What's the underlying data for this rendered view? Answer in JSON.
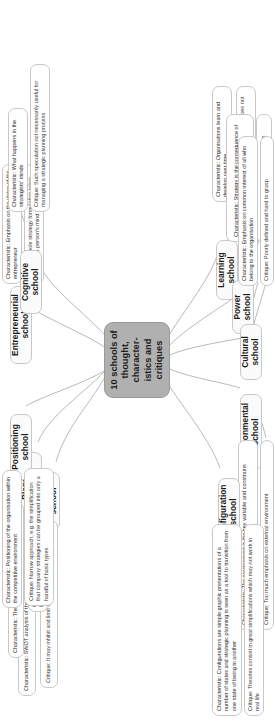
{
  "diagram": {
    "type": "mind-map",
    "central": {
      "label": "10 schools of thought, character-istics and critiques",
      "color": "#b0b0b0"
    },
    "branches": [
      {
        "school": "Design school",
        "characteristic": "Characteristic: SWOT analysis of the organisation",
        "critique": "Critique: It may inhibit and limit creative work"
      },
      {
        "school": "Planning school",
        "characteristic": "Characteristic: The process of strategic planning",
        "critique": "Critique: Emphasis on the planning instead of the results"
      },
      {
        "school": "Positioning school",
        "characteristic": "Characteristic: Positioning of the organisation within the competitive environment",
        "critique": "Critique: Narrow approach, e.g. the simplification that company strategies can be grouped into only a handful of basic types"
      },
      {
        "school": "Entrepreneurial school",
        "characteristic": "Characteristic: Emphasis on the vision of the entrepreneur",
        "critique": "Critique: Whole strategy formulation takes place in one person's mind"
      },
      {
        "school": "Cognitive school",
        "characteristic": "Characteristic: What happens in the strategists' minds",
        "critique": "Critique: Such speculation not necessarily useful for managing a strategic planning process"
      },
      {
        "school": "Learning school",
        "characteristic": "Characteristic: Organisations learn and develop over time",
        "critique": "Critique: Learning is useless if it does not lead to added value"
      },
      {
        "school": "Power school",
        "characteristic": "Characteristic: Strategy is the consequence of negotiations between parties with power",
        "critique": "Critique: Heavy emphasis on negotiations"
      },
      {
        "school": "Cultural school",
        "characteristic": "Characteristic: Emphasis on common interest of all who belong to the organisation",
        "critique": "Critique: Poorly defined and hard to grasp"
      },
      {
        "school": "Environmental school",
        "characteristic": "Characteristic: The environment is the key variable and constrains organisation's possibilities",
        "critique": "Critique: Too much emphasis on external environment"
      },
      {
        "school": "Configuration school",
        "characteristic": "Characteristic: Configurations are simple graphic presentations of a number of states and strategic planning is seen as a tool to transition from one state of being to another",
        "critique": "Critique: Theories consist in great simplifications which may not work in real life"
      }
    ]
  }
}
